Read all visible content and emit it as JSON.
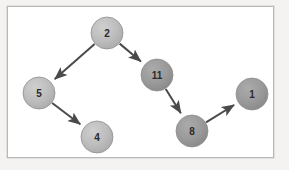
{
  "figure": {
    "title": "",
    "background_color": "#f4f3f1",
    "plate_color": "#ffffff",
    "plate_border_color": "#b9b9b9"
  },
  "graph": {
    "type": "directed-graph",
    "edge_color": "#4a4a4a",
    "node_stroke_color": "#8f8f8f",
    "label_color": "#2b2b2b",
    "node_radius": 16,
    "nodes": [
      {
        "id": "n2",
        "label": "2",
        "cx": 107,
        "cy": 33,
        "r": 16,
        "fill": "#b6b6b6",
        "fill_light": "#c8c8c8",
        "shade": "light"
      },
      {
        "id": "n5",
        "label": "5",
        "cx": 39,
        "cy": 93,
        "r": 16,
        "fill": "#b6b6b6",
        "fill_light": "#c8c8c8",
        "shade": "light"
      },
      {
        "id": "n11",
        "label": "11",
        "cx": 157,
        "cy": 75,
        "r": 16,
        "fill": "#949494",
        "fill_light": "#a6a6a6",
        "shade": "dark"
      },
      {
        "id": "n4",
        "label": "4",
        "cx": 97,
        "cy": 137,
        "r": 16,
        "fill": "#b6b6b6",
        "fill_light": "#c8c8c8",
        "shade": "light"
      },
      {
        "id": "n8",
        "label": "8",
        "cx": 192,
        "cy": 131,
        "r": 16,
        "fill": "#949494",
        "fill_light": "#a6a6a6",
        "shade": "dark"
      },
      {
        "id": "n1",
        "label": "1",
        "cx": 252,
        "cy": 94,
        "r": 16,
        "fill": "#949494",
        "fill_light": "#a6a6a6",
        "shade": "dark"
      }
    ],
    "edges": [
      {
        "id": "e1",
        "from": "n2",
        "to": "n5",
        "directed": true
      },
      {
        "id": "e2",
        "from": "n2",
        "to": "n11",
        "directed": true
      },
      {
        "id": "e3",
        "from": "n5",
        "to": "n4",
        "directed": true
      },
      {
        "id": "e4",
        "from": "n11",
        "to": "n8",
        "directed": true
      },
      {
        "id": "e5",
        "from": "n8",
        "to": "n1",
        "directed": true
      }
    ]
  }
}
